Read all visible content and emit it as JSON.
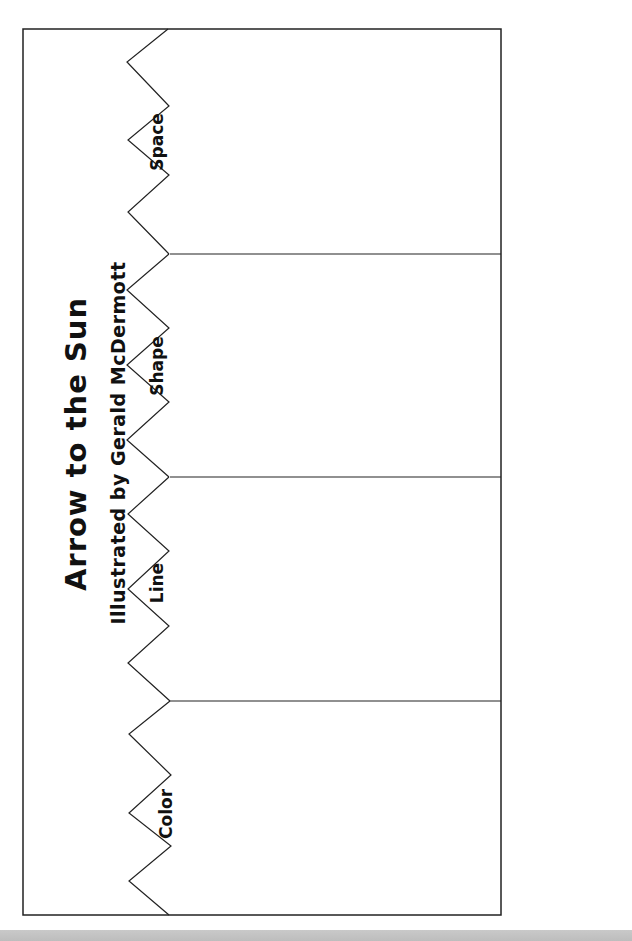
{
  "worksheet": {
    "title": "Arrow to the Sun",
    "subtitle": "Illustrated by Gerald McDermott",
    "sections": [
      {
        "label": "Space"
      },
      {
        "label": "Shape"
      },
      {
        "label": "Line"
      },
      {
        "label": "Color"
      }
    ]
  },
  "colors": {
    "ink": "#111111",
    "paper": "#ffffff",
    "bottom_bar": "#c4c4c4"
  }
}
